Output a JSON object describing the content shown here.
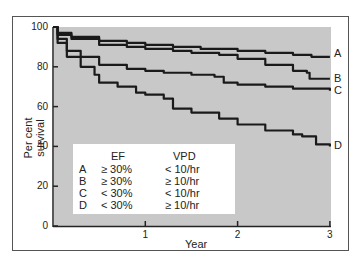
{
  "chart_data": {
    "type": "line",
    "title": "",
    "xlabel": "Year",
    "ylabel": "Per cent survival",
    "xlim": [
      0,
      3
    ],
    "ylim": [
      0,
      100
    ],
    "x_ticks": [
      "1",
      "2",
      "3"
    ],
    "y_ticks": [
      "0",
      "20",
      "40",
      "60",
      "80",
      "100"
    ],
    "grid": false,
    "plot_background": "#c8c8c8",
    "legend_position": "inside lower-left",
    "series": [
      {
        "name": "A",
        "ef": "≥ 30%",
        "vpd": "< 10/hr",
        "x": [
          0,
          0.05,
          0.2,
          0.5,
          0.8,
          1.0,
          1.3,
          1.6,
          2.0,
          2.3,
          2.6,
          2.8,
          3
        ],
        "values": [
          100,
          97,
          95,
          93,
          92,
          91,
          90,
          89,
          88,
          87,
          86,
          85,
          85
        ]
      },
      {
        "name": "B",
        "ef": "≥ 30%",
        "vpd": "≥ 10/hr",
        "x": [
          0,
          0.05,
          0.2,
          0.5,
          0.8,
          1.0,
          1.3,
          1.5,
          1.8,
          2.0,
          2.3,
          2.6,
          2.75,
          2.78,
          3
        ],
        "values": [
          100,
          96,
          94,
          91,
          90,
          89,
          88,
          87,
          86,
          84,
          81,
          78,
          77,
          74,
          74
        ]
      },
      {
        "name": "C",
        "ef": "< 30%",
        "vpd": "< 10/hr",
        "x": [
          0,
          0.05,
          0.15,
          0.3,
          0.5,
          0.8,
          1.0,
          1.2,
          1.5,
          1.75,
          1.85,
          2.0,
          2.3,
          2.6,
          3
        ],
        "values": [
          100,
          94,
          88,
          85,
          81,
          79,
          78,
          77,
          76,
          75,
          72,
          71,
          70,
          69,
          68
        ]
      },
      {
        "name": "D",
        "ef": "< 30%",
        "vpd": "≥ 10/hr",
        "x": [
          0,
          0.05,
          0.15,
          0.3,
          0.45,
          0.5,
          0.7,
          0.9,
          1.0,
          1.2,
          1.3,
          1.5,
          1.8,
          2.0,
          2.3,
          2.6,
          2.7,
          2.85,
          3
        ],
        "values": [
          100,
          92,
          85,
          80,
          76,
          72,
          70,
          67,
          66,
          64,
          59,
          57,
          54,
          51,
          48,
          46,
          45,
          41,
          40
        ]
      }
    ]
  },
  "legend": {
    "headers": {
      "ef": "EF",
      "vpd": "VPD"
    },
    "rows": [
      {
        "label": "A",
        "ef": "≥ 30%",
        "vpd": "< 10/hr"
      },
      {
        "label": "B",
        "ef": "≥ 30%",
        "vpd": "≥ 10/hr"
      },
      {
        "label": "C",
        "ef": "< 30%",
        "vpd": "< 10/hr"
      },
      {
        "label": "D",
        "ef": "< 30%",
        "vpd": "≥ 10/hr"
      }
    ]
  }
}
